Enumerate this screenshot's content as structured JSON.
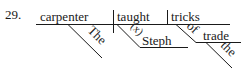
{
  "exercise": {
    "number": "29.",
    "sentence_type": "sentence diagram (Reed-Kellogg)"
  },
  "diagram": {
    "subject": "carpenter",
    "subject_modifier": "The",
    "verb": "taught",
    "direct_object": "tricks",
    "indirect_object": "Steph",
    "indirect_object_marker": "(x)",
    "preposition": "of",
    "prepositional_object": "trade",
    "prepositional_object_modifier": "the"
  }
}
